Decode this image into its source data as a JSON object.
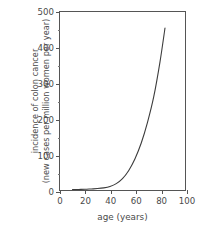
{
  "chart_data": {
    "type": "line",
    "title": "",
    "xlabel": "age (years)",
    "ylabel_line1": "incidence of colon cancer",
    "ylabel_line2": "(new cases per million women per year)",
    "xlim": [
      0,
      100
    ],
    "ylim": [
      0,
      500
    ],
    "grid": false,
    "legend": "none",
    "xticks": [
      0,
      20,
      40,
      60,
      80,
      100
    ],
    "xtick_labels": [
      "0",
      "20",
      "40",
      "60",
      "80",
      "100"
    ],
    "yticks": [
      0,
      100,
      200,
      300,
      400,
      500
    ],
    "ytick_labels": [
      "0",
      "100",
      "200",
      "300",
      "400",
      "500"
    ],
    "yticks_minor": [
      50,
      150,
      250,
      350,
      450
    ],
    "series": [
      {
        "name": "colon cancer incidence in women",
        "color": "#3c3c3c",
        "x": [
          10,
          15,
          20,
          25,
          30,
          35,
          40,
          45,
          50,
          55,
          60,
          65,
          70,
          75,
          80,
          84
        ],
        "y": [
          1,
          1.5,
          2,
          3,
          4,
          6,
          10,
          18,
          32,
          55,
          88,
          132,
          190,
          262,
          360,
          455
        ]
      }
    ]
  }
}
